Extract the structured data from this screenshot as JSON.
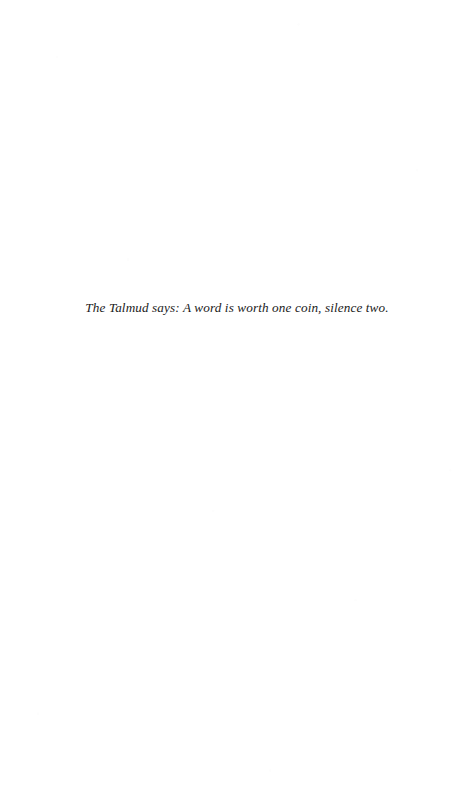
{
  "page": {
    "width": 474,
    "height": 811,
    "background_color": "#ffffff",
    "kind": "epigraph-page"
  },
  "content": {
    "epigraph": {
      "text": "The Talmud says: A word is worth one coin, silence two.",
      "style": "italic",
      "text_color": "#1b1b1b",
      "alignment": "center"
    }
  }
}
